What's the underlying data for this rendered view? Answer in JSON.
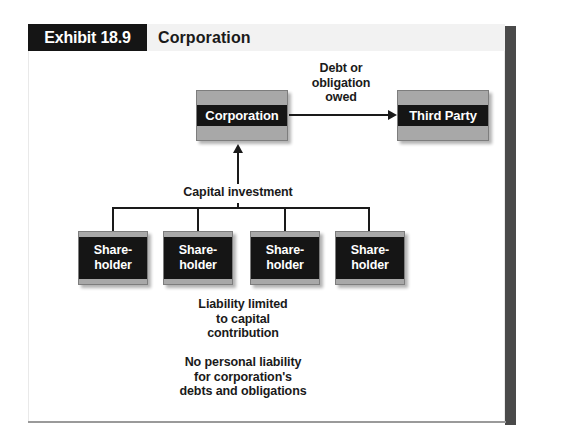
{
  "exhibit": {
    "tag_label": "Exhibit 18.9",
    "title": "Corporation"
  },
  "diagram": {
    "nodes": {
      "corporation": "Corporation",
      "third_party": "Third Party",
      "shareholder_line1": "Share-",
      "shareholder_line2": "holder"
    },
    "shareholders": [
      {
        "line1": "Share-",
        "line2": "holder"
      },
      {
        "line1": "Share-",
        "line2": "holder"
      },
      {
        "line1": "Share-",
        "line2": "holder"
      },
      {
        "line1": "Share-",
        "line2": "holder"
      }
    ],
    "labels": {
      "debt_line1": "Debt or",
      "debt_line2": "obligation",
      "debt_line3": "owed",
      "capital_investment": "Capital investment",
      "liability_line1": "Liability limited",
      "liability_line2": "to capital",
      "liability_line3": "contribution",
      "no_liability_line1": "No personal liability",
      "no_liability_line2": "for corporation's",
      "no_liability_line3": "debts and obligations"
    }
  },
  "colors": {
    "black": "#151515",
    "box_gray": "#a8a8a8",
    "header_gray": "#f2f2f2",
    "side_bar_gray": "#4a4a4a",
    "rule_gray": "#9a9a9a"
  }
}
